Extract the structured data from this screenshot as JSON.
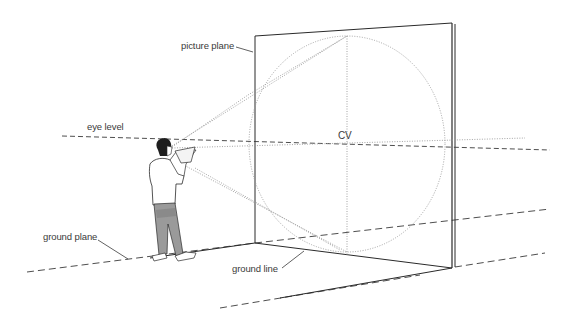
{
  "diagram": {
    "labels": {
      "picture_plane": "picture plane",
      "eye_level": "eye level",
      "cv": "CV",
      "ground_plane": "ground plane",
      "ground_line": "ground line"
    },
    "elements": [
      {
        "name": "picture-plane",
        "type": "rectangle-in-perspective"
      },
      {
        "name": "cone-of-vision-circle",
        "type": "dotted-circle"
      },
      {
        "name": "eye-level-line",
        "type": "dashed-line"
      },
      {
        "name": "ground-line",
        "type": "solid-line"
      },
      {
        "name": "ground-plane-edges",
        "type": "dashed-lines"
      },
      {
        "name": "sight-lines",
        "type": "dotted-lines"
      },
      {
        "name": "observer",
        "type": "figure"
      }
    ],
    "colors": {
      "ink": "#2a2a2a",
      "dotted": "#9a9a9a",
      "background": "#ffffff"
    }
  }
}
